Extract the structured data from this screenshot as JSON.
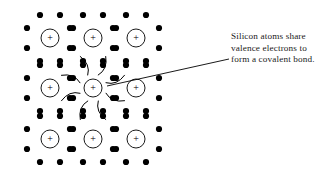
{
  "figure": {
    "kind": "silicon-covalent-bond-lattice-diagram",
    "background_color": "#ffffff",
    "ink_color": "#000000",
    "text_color": "#1a1a1a"
  },
  "annotation": {
    "lines": [
      "Silicon atoms share",
      "valence electrons to",
      "form a covalent bond."
    ],
    "full_text": "Silicon atoms share valence electrons to form a covalent bond."
  },
  "leader_line": {
    "from_x": 107,
    "from_y": 86,
    "to_x": 229,
    "to_y": 59,
    "stroke": "#000000",
    "stroke_width": 0.9
  },
  "lattice": {
    "columns": 3,
    "rows": 3,
    "x_positions": [
      50,
      93,
      136
    ],
    "y_positions": [
      38,
      88,
      139
    ],
    "nucleus": {
      "radius": 9,
      "stroke": "#000000",
      "stroke_width": 0.9,
      "fill": "#ffffff",
      "charge_symbol": "+"
    },
    "electron_dot": {
      "radius": 3.1,
      "fill": "#000000"
    },
    "atoms": [
      {
        "col": 0,
        "row": 0,
        "cx": 50,
        "cy": 38,
        "name": "atom-top-left"
      },
      {
        "col": 1,
        "row": 0,
        "cx": 93,
        "cy": 38,
        "name": "atom-top-center"
      },
      {
        "col": 2,
        "row": 0,
        "cx": 136,
        "cy": 38,
        "name": "atom-top-right"
      },
      {
        "col": 0,
        "row": 1,
        "cx": 50,
        "cy": 88,
        "name": "atom-middle-left"
      },
      {
        "col": 1,
        "row": 1,
        "cx": 93,
        "cy": 88,
        "name": "atom-center"
      },
      {
        "col": 2,
        "row": 1,
        "cx": 136,
        "cy": 88,
        "name": "atom-middle-right"
      },
      {
        "col": 0,
        "row": 2,
        "cx": 50,
        "cy": 139,
        "name": "atom-bottom-left"
      },
      {
        "col": 1,
        "row": 2,
        "cx": 93,
        "cy": 139,
        "name": "atom-bottom-center"
      },
      {
        "col": 2,
        "row": 2,
        "cx": 136,
        "cy": 139,
        "name": "atom-bottom-right"
      }
    ],
    "dot_offsets": [
      {
        "dx": -10,
        "dy": -23
      },
      {
        "dx": 10,
        "dy": -23
      },
      {
        "dx": -23,
        "dy": -10
      },
      {
        "dx": -23,
        "dy": 10
      },
      {
        "dx": 23,
        "dy": -10
      },
      {
        "dx": 23,
        "dy": 10
      },
      {
        "dx": -10,
        "dy": 23
      },
      {
        "dx": 10,
        "dy": 23
      }
    ],
    "bond_arcs": {
      "count": 8,
      "center_atom_cx": 93,
      "center_atom_cy": 88,
      "stroke": "#000000",
      "stroke_width": 1.0,
      "inner_radius": 14,
      "outer_radius": 34,
      "angles_deg": [
        22,
        68,
        112,
        158,
        202,
        248,
        292,
        338
      ],
      "description": "curved arcs radiating from the central silicon atom toward each shared valence electron pair"
    }
  }
}
